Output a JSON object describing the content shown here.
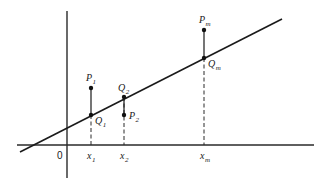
{
  "diagram": {
    "type": "least-squares regression illustration",
    "axes": {
      "origin_label": "0",
      "x_axis": {
        "from": [
          17,
          145
        ],
        "to": [
          314,
          145
        ]
      },
      "y_axis": {
        "from": [
          67,
          11
        ],
        "to": [
          67,
          178
        ]
      }
    },
    "regression_line": {
      "from": [
        20,
        152
      ],
      "to": [
        282,
        19
      ]
    },
    "points": [
      {
        "id": "p1",
        "label": "P",
        "sub": "1",
        "x": 91,
        "y": 88,
        "label_pos": [
          86,
          81
        ]
      },
      {
        "id": "q1",
        "label": "Q",
        "sub": "1",
        "x": 91,
        "y": 115,
        "label_pos": [
          95,
          124
        ]
      },
      {
        "id": "q2",
        "label": "Q",
        "sub": "2",
        "x": 124,
        "y": 97,
        "label_pos": [
          118,
          91
        ]
      },
      {
        "id": "p2",
        "label": "P",
        "sub": "2",
        "x": 124,
        "y": 115,
        "label_pos": [
          129,
          119
        ]
      },
      {
        "id": "pm",
        "label": "P",
        "sub": "m",
        "x": 204,
        "y": 30,
        "label_pos": [
          199,
          23
        ]
      },
      {
        "id": "qm",
        "label": "Q",
        "sub": "m",
        "x": 204,
        "y": 58,
        "label_pos": [
          208,
          67
        ]
      }
    ],
    "verticals": [
      {
        "x": 91,
        "solid_from": 88,
        "solid_to": 115,
        "dash_from": 115,
        "dash_to": 145
      },
      {
        "x": 124,
        "solid_from": 97,
        "solid_to": 115,
        "dash_from": 97,
        "dash_to": 145
      },
      {
        "x": 204,
        "solid_from": 30,
        "solid_to": 58,
        "dash_from": 58,
        "dash_to": 145
      }
    ],
    "x_ticks": [
      {
        "label": "x",
        "sub": "1",
        "x": 87,
        "y": 159
      },
      {
        "label": "x",
        "sub": "2",
        "x": 120,
        "y": 159
      },
      {
        "label": "x",
        "sub": "m",
        "x": 200,
        "y": 159
      }
    ],
    "zero_label_pos": [
      57,
      159
    ]
  }
}
